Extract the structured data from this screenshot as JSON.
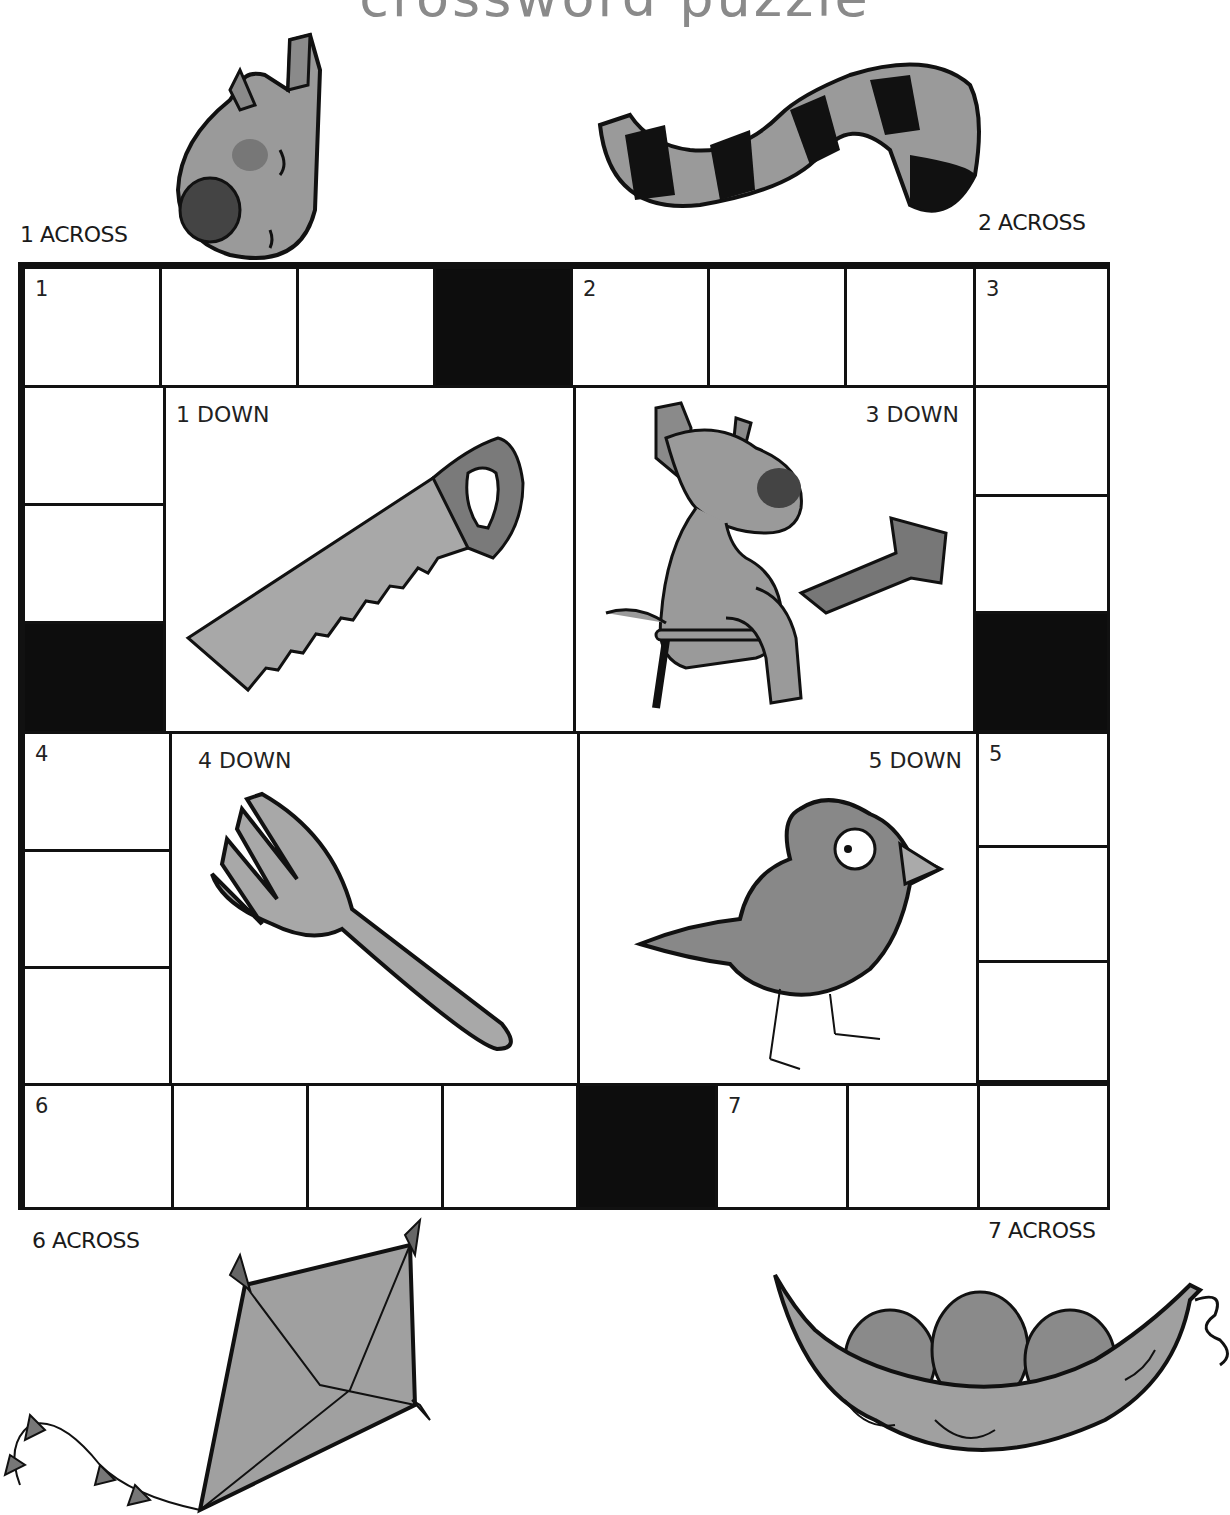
{
  "title": "crossword puzzle",
  "colors": {
    "ink": "#111111",
    "illustration_fill": "#9a9a9a",
    "illustration_dark": "#555555",
    "title": "#8a8a8a"
  },
  "clue_labels": {
    "across_1": "1 ACROSS",
    "across_2": "2 ACROSS",
    "across_6": "6 ACROSS",
    "across_7": "7 ACROSS"
  },
  "panels": {
    "down_1": {
      "label": "1 DOWN",
      "picture": "saw"
    },
    "down_3": {
      "label": "3 DOWN",
      "picture": "dog-sitting-on-stool-with-arrow"
    },
    "down_4": {
      "label": "4 DOWN",
      "picture": "fork"
    },
    "down_5": {
      "label": "5 DOWN",
      "picture": "bird"
    }
  },
  "pictures": {
    "across_1": "dog-head",
    "across_2": "striped-tail",
    "across_6": "kite",
    "across_7": "peas-in-pod"
  },
  "cell_numbers": {
    "n1": "1",
    "n2": "2",
    "n3": "3",
    "n4": "4",
    "n5": "5",
    "n6": "6",
    "n7": "7"
  }
}
